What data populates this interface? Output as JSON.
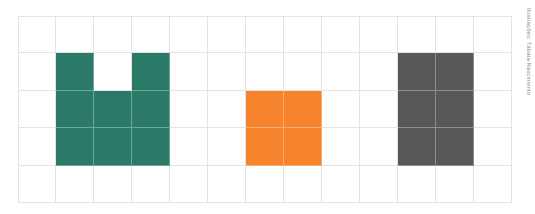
{
  "figure": {
    "name": "shapes-on-grid-figure",
    "credit": "Ilustrações: Tábata Nascimento"
  },
  "grid": {
    "columns": 13,
    "rows": 5,
    "line_color": "#e3e3e4",
    "background": "#ffffff",
    "cell_width_px": 38,
    "cell_height_px": 37
  },
  "shapes": [
    {
      "id": "green-u-shape",
      "label": "Green U-shaped figure",
      "color": "#2b7a67",
      "area_cells": 8,
      "cells": [
        [
          1,
          1
        ],
        [
          1,
          3
        ],
        [
          2,
          1
        ],
        [
          2,
          2
        ],
        [
          2,
          3
        ],
        [
          3,
          1
        ],
        [
          3,
          2
        ],
        [
          3,
          3
        ]
      ]
    },
    {
      "id": "orange-square",
      "label": "Orange square figure",
      "color": "#f7832c",
      "area_cells": 4,
      "cells": [
        [
          2,
          6
        ],
        [
          2,
          7
        ],
        [
          3,
          6
        ],
        [
          3,
          7
        ]
      ]
    },
    {
      "id": "gray-rectangle",
      "label": "Gray rectangle figure",
      "color": "#57585a",
      "area_cells": 6,
      "cells": [
        [
          1,
          10
        ],
        [
          1,
          11
        ],
        [
          2,
          10
        ],
        [
          2,
          11
        ],
        [
          3,
          10
        ],
        [
          3,
          11
        ]
      ]
    }
  ]
}
